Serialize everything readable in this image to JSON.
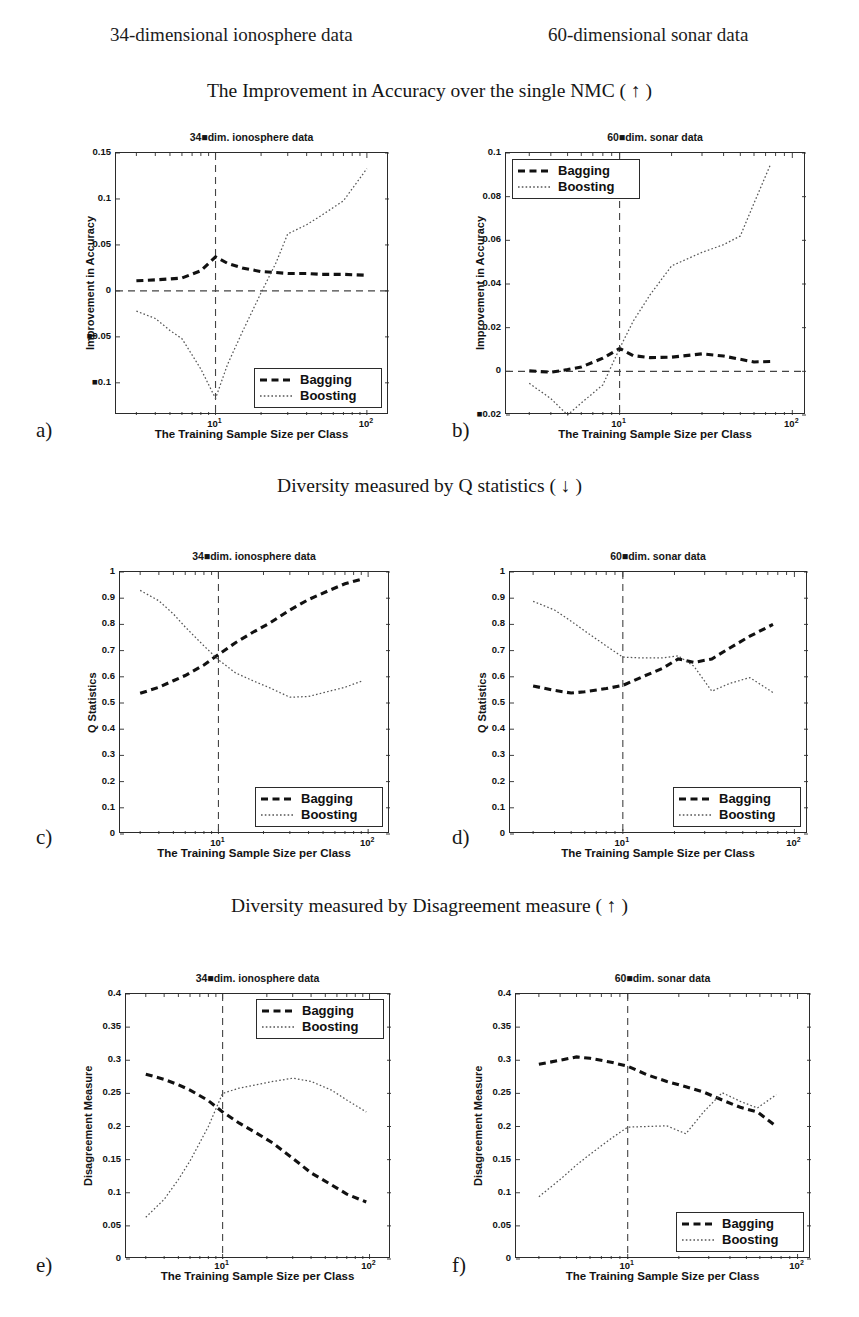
{
  "headers": {
    "left_column": "34-dimensional ionosphere data",
    "right_column": "60-dimensional sonar data"
  },
  "sections": [
    {
      "id": "accuracy",
      "title": "The Improvement in Accuracy over the single NMC ( ↑ )"
    },
    {
      "id": "qstatistics",
      "title": "Diversity measured by Q statistics ( ↓ )"
    },
    {
      "id": "disagreement",
      "title": "Diversity measured by Disagreement measure ( ↑ )"
    }
  ],
  "legend": {
    "bagging": "Bagging",
    "boosting": "Boosting"
  },
  "axis_labels": {
    "x": "The Training Sample Size per Class",
    "y_accuracy": "Improvement in Accuracy",
    "y_q": "Q Statistics",
    "y_disagreement": "Disagreement Measure"
  },
  "panel_tags": [
    "a)",
    "b)",
    "c)",
    "d)",
    "e)",
    "f)"
  ],
  "colors": {
    "axis": "#2b2b2b",
    "bagging": "#111111",
    "boosting": "#555555",
    "reference_line": "#444444"
  },
  "chart_data": [
    {
      "id": "a",
      "type": "line",
      "title": "34■dim. ionosphere data",
      "xlabel": "The Training Sample Size per Class",
      "ylabel": "Improvement in Accuracy",
      "xscale": "log",
      "xlim": [
        2.2,
        140
      ],
      "ylim": [
        -0.135,
        0.15
      ],
      "xticks": [
        10,
        100
      ],
      "xticklabels": [
        "10¹",
        "10²"
      ],
      "yticks": [
        0.15,
        0.1,
        0.05,
        0,
        -0.05,
        -0.1
      ],
      "yticklabels": [
        "0.15",
        "0.1",
        "0.05",
        "0",
        "■0.05",
        "■0.1"
      ],
      "grid": false,
      "legend_position": "lower-right",
      "vline_at_x": 10,
      "hline_at_y": 0,
      "series": [
        {
          "name": "Bagging",
          "x": [
            3,
            4,
            5,
            6,
            8,
            10,
            12,
            15,
            20,
            25,
            30,
            40,
            50,
            70,
            100
          ],
          "values": [
            0.011,
            0.012,
            0.013,
            0.014,
            0.022,
            0.037,
            0.03,
            0.025,
            0.021,
            0.02,
            0.019,
            0.019,
            0.018,
            0.018,
            0.017
          ]
        },
        {
          "name": "Boosting",
          "x": [
            3,
            4,
            5,
            6,
            8,
            10,
            12,
            15,
            20,
            25,
            30,
            40,
            50,
            70,
            100
          ],
          "values": [
            -0.022,
            -0.03,
            -0.043,
            -0.052,
            -0.085,
            -0.117,
            -0.08,
            -0.045,
            -0.002,
            0.03,
            0.062,
            0.072,
            0.082,
            0.098,
            0.133
          ]
        }
      ]
    },
    {
      "id": "b",
      "type": "line",
      "title": "60■dim. sonar data",
      "xlabel": "The Training Sample Size per Class",
      "ylabel": "Improvement in Accuracy",
      "xscale": "log",
      "xlim": [
        2.2,
        120
      ],
      "ylim": [
        -0.02,
        0.1
      ],
      "xticks": [
        10,
        100
      ],
      "xticklabels": [
        "10¹",
        "10²"
      ],
      "yticks": [
        0.1,
        0.08,
        0.06,
        0.04,
        0.02,
        0,
        -0.02
      ],
      "yticklabels": [
        "0.1",
        "0.08",
        "0.06",
        "0.04",
        "0.02",
        "0",
        "■0.02"
      ],
      "grid": false,
      "legend_position": "upper-left",
      "vline_at_x": 10,
      "hline_at_y": 0,
      "series": [
        {
          "name": "Bagging",
          "x": [
            3,
            4,
            5,
            6,
            8,
            10,
            12,
            15,
            20,
            30,
            40,
            50,
            60,
            75
          ],
          "values": [
            0.0002,
            -0.0004,
            0.0008,
            0.002,
            0.006,
            0.0105,
            0.0072,
            0.0063,
            0.0065,
            0.008,
            0.007,
            0.0055,
            0.0043,
            0.0045
          ]
        },
        {
          "name": "Boosting",
          "x": [
            3,
            4,
            5,
            6,
            8,
            10,
            12,
            15,
            20,
            30,
            40,
            50,
            60,
            75
          ],
          "values": [
            -0.0055,
            -0.0125,
            -0.02,
            -0.0145,
            -0.0062,
            0.0105,
            0.023,
            0.035,
            0.0483,
            0.0545,
            0.058,
            0.062,
            0.077,
            0.095
          ]
        }
      ]
    },
    {
      "id": "c",
      "type": "line",
      "title": "34■dim. ionosphere data",
      "xlabel": "The Training Sample Size per Class",
      "ylabel": "Q Statistics",
      "xscale": "log",
      "xlim": [
        2.2,
        140
      ],
      "ylim": [
        0,
        1
      ],
      "xticks": [
        10,
        100
      ],
      "xticklabels": [
        "10¹",
        "10²"
      ],
      "yticks": [
        1,
        0.9,
        0.8,
        0.7,
        0.6,
        0.5,
        0.4,
        0.3,
        0.2,
        0.1,
        0
      ],
      "yticklabels": [
        "1",
        "0.9",
        "0.8",
        "0.7",
        "0.6",
        "0.5",
        "0.4",
        "0.3",
        "0.2",
        "0.1",
        "0"
      ],
      "grid": false,
      "legend_position": "lower-right",
      "vline_at_x": 10,
      "series": [
        {
          "name": "Bagging",
          "x": [
            3,
            4,
            5,
            6,
            8,
            10,
            13,
            17,
            22,
            30,
            40,
            55,
            70,
            90
          ],
          "values": [
            0.537,
            0.56,
            0.585,
            0.605,
            0.645,
            0.685,
            0.73,
            0.77,
            0.805,
            0.855,
            0.895,
            0.93,
            0.955,
            0.972
          ]
        },
        {
          "name": "Boosting",
          "x": [
            3,
            4,
            5,
            6,
            8,
            10,
            13,
            17,
            22,
            30,
            40,
            55,
            70,
            90
          ],
          "values": [
            0.93,
            0.89,
            0.84,
            0.79,
            0.718,
            0.665,
            0.615,
            0.585,
            0.558,
            0.522,
            0.525,
            0.545,
            0.56,
            0.583
          ]
        }
      ]
    },
    {
      "id": "d",
      "type": "line",
      "title": "60■dim. sonar data",
      "xlabel": "The Training Sample Size per Class",
      "ylabel": "Q Statistics",
      "xscale": "log",
      "xlim": [
        2.2,
        120
      ],
      "ylim": [
        0,
        1
      ],
      "xticks": [
        10,
        100
      ],
      "xticklabels": [
        "10¹",
        "10²"
      ],
      "yticks": [
        1,
        0.9,
        0.8,
        0.7,
        0.6,
        0.5,
        0.4,
        0.3,
        0.2,
        0.1,
        0
      ],
      "yticklabels": [
        "1",
        "0.9",
        "0.8",
        "0.7",
        "0.6",
        "0.5",
        "0.4",
        "0.3",
        "0.2",
        "0.1",
        "0"
      ],
      "grid": false,
      "legend_position": "lower-right",
      "vline_at_x": 10,
      "series": [
        {
          "name": "Bagging",
          "x": [
            3,
            4,
            5,
            6,
            8,
            10,
            13,
            17,
            21,
            26,
            33,
            42,
            55,
            75
          ],
          "values": [
            0.565,
            0.548,
            0.538,
            0.543,
            0.555,
            0.567,
            0.6,
            0.632,
            0.668,
            0.655,
            0.668,
            0.71,
            0.755,
            0.8
          ]
        },
        {
          "name": "Boosting",
          "x": [
            3,
            4,
            5,
            6,
            8,
            10,
            13,
            17,
            21,
            26,
            33,
            42,
            55,
            75
          ],
          "values": [
            0.888,
            0.855,
            0.812,
            0.775,
            0.718,
            0.675,
            0.672,
            0.672,
            0.68,
            0.64,
            0.545,
            0.575,
            0.597,
            0.54
          ]
        }
      ]
    },
    {
      "id": "e",
      "type": "line",
      "title": "34■dim. ionosphere data",
      "xlabel": "The Training Sample Size per Class",
      "ylabel": "Disagreement Measure",
      "xscale": "log",
      "xlim": [
        2.2,
        140
      ],
      "ylim": [
        0,
        0.4
      ],
      "xticks": [
        10,
        100
      ],
      "xticklabels": [
        "10¹",
        "10²"
      ],
      "yticks": [
        0.4,
        0.35,
        0.3,
        0.25,
        0.2,
        0.15,
        0.1,
        0.05,
        0
      ],
      "yticklabels": [
        "0.4",
        "0.35",
        "0.3",
        "0.25",
        "0.2",
        "0.15",
        "0.1",
        "0.05",
        "0"
      ],
      "grid": false,
      "legend_position": "upper-right",
      "vline_at_x": 10,
      "series": [
        {
          "name": "Bagging",
          "x": [
            3,
            4,
            5,
            6,
            8,
            10,
            13,
            17,
            22,
            30,
            40,
            55,
            70,
            95
          ],
          "values": [
            0.279,
            0.271,
            0.263,
            0.255,
            0.239,
            0.222,
            0.205,
            0.19,
            0.175,
            0.152,
            0.13,
            0.112,
            0.098,
            0.086
          ]
        },
        {
          "name": "Boosting",
          "x": [
            3,
            4,
            5,
            6,
            8,
            10,
            13,
            17,
            22,
            30,
            40,
            55,
            70,
            95
          ],
          "values": [
            0.063,
            0.09,
            0.12,
            0.148,
            0.2,
            0.25,
            0.258,
            0.263,
            0.268,
            0.273,
            0.268,
            0.255,
            0.24,
            0.222
          ]
        }
      ]
    },
    {
      "id": "f",
      "type": "line",
      "title": "60■dim. sonar data",
      "xlabel": "The Training Sample Size per Class",
      "ylabel": "Disagreement Measure",
      "xscale": "log",
      "xlim": [
        2.2,
        120
      ],
      "ylim": [
        0,
        0.4
      ],
      "xticks": [
        10,
        100
      ],
      "xticklabels": [
        "10¹",
        "10²"
      ],
      "yticks": [
        0.4,
        0.35,
        0.3,
        0.25,
        0.2,
        0.15,
        0.1,
        0.05,
        0
      ],
      "yticklabels": [
        "0.4",
        "0.35",
        "0.3",
        "0.25",
        "0.2",
        "0.15",
        "0.1",
        "0.05",
        "0"
      ],
      "grid": false,
      "legend_position": "lower-right",
      "vline_at_x": 10,
      "series": [
        {
          "name": "Bagging",
          "x": [
            3,
            4,
            5,
            6,
            8,
            10,
            13,
            17,
            22,
            28,
            36,
            46,
            58,
            75
          ],
          "values": [
            0.294,
            0.3,
            0.305,
            0.303,
            0.297,
            0.291,
            0.278,
            0.268,
            0.26,
            0.252,
            0.24,
            0.229,
            0.222,
            0.2
          ]
        },
        {
          "name": "Boosting",
          "x": [
            3,
            4,
            5,
            6,
            8,
            10,
            13,
            17,
            22,
            28,
            36,
            46,
            58,
            75
          ],
          "values": [
            0.094,
            0.12,
            0.142,
            0.158,
            0.182,
            0.199,
            0.2,
            0.201,
            0.189,
            0.222,
            0.251,
            0.238,
            0.228,
            0.248
          ]
        }
      ]
    }
  ]
}
